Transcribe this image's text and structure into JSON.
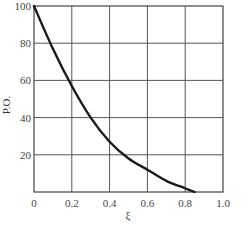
{
  "chart_data": {
    "type": "line",
    "title": "",
    "xlabel": "ξ",
    "ylabel": "P.O.",
    "xlim": [
      0,
      1.0
    ],
    "ylim": [
      0,
      100
    ],
    "grid": true,
    "legend": null,
    "x_ticks": [
      "0",
      "0.2",
      "0.4",
      "0.6",
      "0.8",
      "1.0"
    ],
    "y_ticks": [
      "20",
      "40",
      "60",
      "80",
      "100"
    ],
    "series": [
      {
        "name": "P.O. vs ξ",
        "x": [
          0.0,
          0.1,
          0.2,
          0.3,
          0.4,
          0.5,
          0.6,
          0.7,
          0.8,
          0.85
        ],
        "y": [
          100,
          77,
          57,
          40,
          27,
          18,
          12,
          6,
          2,
          0
        ]
      }
    ],
    "colors": {
      "curve": "#1a1a1a",
      "grid": "#555555",
      "background": "#ffffff"
    }
  }
}
